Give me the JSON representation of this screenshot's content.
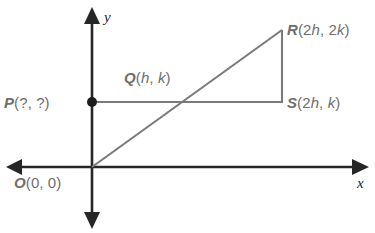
{
  "figure": {
    "type": "coordinate-geometry-diagram",
    "background_color": "#ffffff",
    "axis_color": "#262626",
    "figure_line_color": "#7a7a7a",
    "label_color": "#6e6e6e",
    "axes": {
      "x_label": "x",
      "y_label": "y",
      "origin_label": "O(0, 0)"
    },
    "points": {
      "P": {
        "name": "P",
        "coords": "(?, ?)",
        "full": "P(?, ?)"
      },
      "Q": {
        "name": "Q",
        "coords": "(h, k)",
        "full": "Q(h, k)"
      },
      "R": {
        "name": "R",
        "coords": "(2h, 2k)",
        "full": "R(2h, 2k)"
      },
      "S": {
        "name": "S",
        "coords": "(2h, k)",
        "full": "S(2h, k)"
      },
      "O": {
        "name": "O",
        "coords": "(0, 0)",
        "full": "O(0, 0)"
      }
    },
    "label_parts": {
      "P_name": "P",
      "P_open": "(?, ?)",
      "Q_name": "Q",
      "Q_open": "(",
      "Q_v1": "h",
      "Q_comma": ", ",
      "Q_v2": "k",
      "Q_close": ")",
      "R_name": "R",
      "R_open": "(2",
      "R_v1": "h",
      "R_comma": ", 2",
      "R_v2": "k",
      "R_close": ")",
      "S_name": "S",
      "S_open": "(2",
      "S_v1": "h",
      "S_comma": ", ",
      "S_v2": "k",
      "S_close": ")",
      "O_name": "O",
      "O_open": "(0, 0)"
    }
  }
}
